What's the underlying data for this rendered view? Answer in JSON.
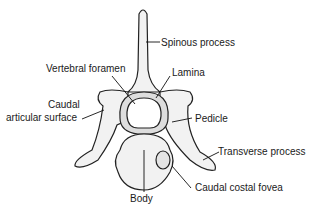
{
  "diagram": {
    "labels": {
      "spinous_process": "Spinous process",
      "vertebral_foramen": "Vertebral foramen",
      "lamina": "Lamina",
      "caudal_articular_line1": "Caudal",
      "caudal_articular_line2": "articular surface",
      "pedicle": "Pedicle",
      "transverse_process": "Transverse process",
      "body": "Body",
      "caudal_costal_fovea": "Caudal costal fovea"
    }
  }
}
